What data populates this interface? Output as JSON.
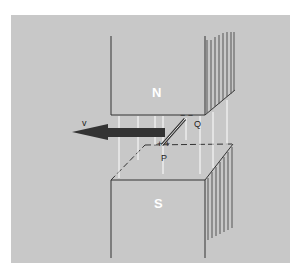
{
  "diagram": {
    "north_label": "N",
    "south_label": "S",
    "velocity_label": "v",
    "point_q_label": "Q",
    "point_p_label": "P",
    "colors": {
      "background": "#c8c8c8",
      "arrow": "#333333",
      "field_lines": "#ffffff"
    }
  }
}
